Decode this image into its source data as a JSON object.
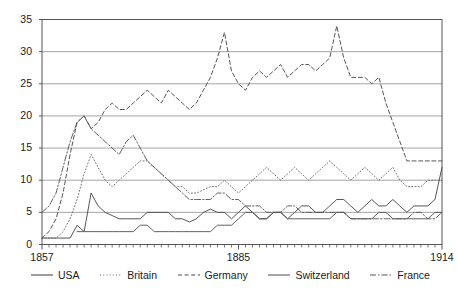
{
  "chart_data": {
    "type": "line",
    "title": "",
    "xlabel": "",
    "ylabel": "",
    "xlim": [
      1857,
      1914
    ],
    "ylim": [
      0,
      35
    ],
    "yticks": [
      0,
      5,
      10,
      15,
      20,
      25,
      30,
      35
    ],
    "xticks": [
      1857,
      1885,
      1914
    ],
    "xtick_labels": [
      "1857",
      "1885",
      "1914"
    ],
    "grid": "horizontal",
    "legend_position": "below",
    "x": [
      1857,
      1858,
      1859,
      1860,
      1861,
      1862,
      1863,
      1864,
      1865,
      1866,
      1867,
      1868,
      1869,
      1870,
      1871,
      1872,
      1873,
      1874,
      1875,
      1876,
      1877,
      1878,
      1879,
      1880,
      1881,
      1882,
      1883,
      1884,
      1885,
      1886,
      1887,
      1888,
      1889,
      1890,
      1891,
      1892,
      1893,
      1894,
      1895,
      1896,
      1897,
      1898,
      1899,
      1900,
      1901,
      1902,
      1903,
      1904,
      1905,
      1906,
      1907,
      1908,
      1909,
      1910,
      1911,
      1912,
      1913,
      1914
    ],
    "series": [
      {
        "name": "USA",
        "style": "solid",
        "color": "#4d4d4d",
        "values": [
          1,
          1,
          1,
          1,
          1,
          3,
          2,
          8,
          6,
          5,
          4.5,
          4,
          4,
          4,
          4,
          5,
          5,
          5,
          5,
          4,
          4,
          3.5,
          4,
          5,
          5.5,
          5,
          5,
          4,
          5,
          6,
          5,
          4,
          4,
          5,
          5,
          4,
          5,
          6,
          6,
          5,
          5,
          6,
          7,
          7,
          6,
          5,
          6,
          7,
          6,
          6,
          7,
          6,
          5,
          6,
          6,
          6,
          7,
          12
        ]
      },
      {
        "name": "Britain",
        "style": "dotted",
        "color": "#6b6b6b",
        "values": [
          1,
          1,
          1,
          2,
          4,
          7,
          11,
          14,
          12,
          10,
          9,
          10,
          11,
          12,
          13,
          13,
          12,
          11,
          10,
          9,
          9,
          8,
          8,
          8.5,
          9,
          9,
          10,
          9,
          8,
          9,
          10,
          11,
          12,
          11,
          10,
          11,
          12,
          11,
          10,
          11,
          12,
          13,
          12,
          11,
          10,
          11,
          12,
          11,
          10,
          11,
          12,
          10,
          9,
          9,
          9,
          10,
          10,
          10
        ]
      },
      {
        "name": "Germany",
        "style": "dashed",
        "color": "#4d4d4d",
        "values": [
          1,
          2,
          4,
          8,
          14,
          19,
          20,
          18,
          19,
          21,
          22,
          21,
          21,
          22,
          23,
          24,
          23,
          22,
          24,
          23,
          22,
          21,
          22,
          24,
          26,
          29,
          33,
          27,
          25,
          24,
          26,
          27,
          26,
          27,
          28,
          26,
          27,
          28,
          28,
          27,
          28,
          29,
          34,
          29,
          26,
          26,
          26,
          25,
          26,
          22,
          19,
          16,
          13,
          13,
          13,
          13,
          13,
          13
        ]
      },
      {
        "name": "Switzerland",
        "style": "solid",
        "color": "#595959",
        "values": [
          null,
          null,
          null,
          null,
          null,
          2,
          2,
          2,
          2,
          2,
          2,
          2,
          2,
          2,
          3,
          3,
          2,
          2,
          2,
          2,
          2,
          2,
          2,
          2,
          2,
          3,
          3,
          3,
          4,
          5,
          5,
          4,
          4,
          5,
          5,
          4,
          4,
          4,
          4,
          4,
          4,
          4,
          5,
          5,
          4,
          4,
          4,
          4,
          5,
          5,
          4,
          4,
          4,
          4,
          4,
          4,
          5,
          5
        ]
      },
      {
        "name": "France",
        "style": "dashdot",
        "color": "#595959",
        "values": [
          5,
          6,
          8,
          12,
          16,
          19,
          20,
          18,
          17,
          16,
          15,
          14,
          16,
          17,
          15,
          13,
          12,
          11,
          10,
          9,
          8,
          7,
          7,
          7,
          7,
          8,
          8,
          7,
          7,
          6,
          6,
          6,
          5,
          5,
          5,
          6,
          6,
          5,
          5,
          5,
          5,
          5,
          5,
          5,
          4,
          4,
          4,
          4,
          4,
          4,
          4,
          4,
          4,
          5,
          5,
          4,
          4,
          5
        ]
      }
    ]
  },
  "legend": {
    "items": [
      {
        "label": "USA",
        "style": "solid"
      },
      {
        "label": "Britain",
        "style": "dotted"
      },
      {
        "label": "Germany",
        "style": "dashed"
      },
      {
        "label": "Switzerland",
        "style": "solid"
      },
      {
        "label": "France",
        "style": "dashdot"
      }
    ]
  },
  "axes": {
    "y_labels": [
      "35",
      "30",
      "25",
      "20",
      "15",
      "10",
      "5",
      "0"
    ],
    "x_labels": [
      "1857",
      "1885",
      "1914"
    ]
  }
}
